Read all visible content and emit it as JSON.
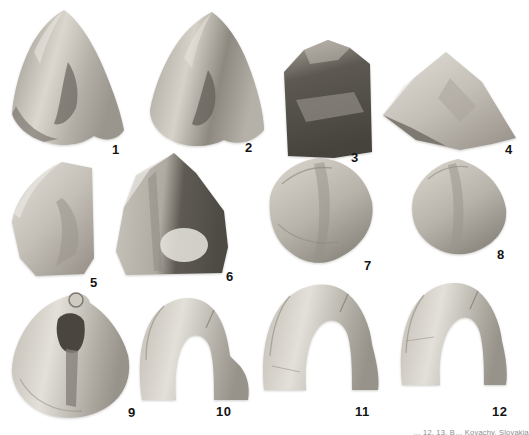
{
  "figure": {
    "plate_title": "fossil specimen plate",
    "specimens": [
      {
        "label": "1"
      },
      {
        "label": "2"
      },
      {
        "label": "3"
      },
      {
        "label": "4"
      },
      {
        "label": "5"
      },
      {
        "label": "6"
      },
      {
        "label": "7"
      },
      {
        "label": "8"
      },
      {
        "label": "9"
      },
      {
        "label": "10"
      },
      {
        "label": "11"
      },
      {
        "label": "12"
      }
    ],
    "caption": "… 12, 13. B… Kovachy, Slovakia",
    "colors": {
      "background": "#ffffff",
      "label": "#141414",
      "caption": "#8d8d8d",
      "specimen_light": "#d9d5cd",
      "specimen_dark": "#57534c"
    }
  }
}
